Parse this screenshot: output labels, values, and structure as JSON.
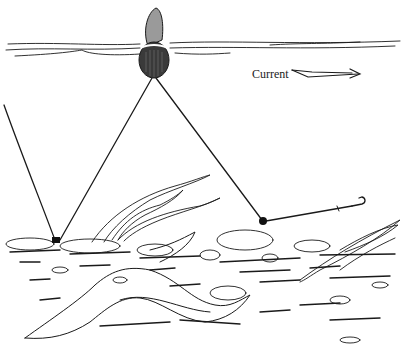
{
  "illustration": {
    "subject": "fishing float rig over riverbed",
    "current_label": "Current",
    "colors": {
      "ink": "#1a1a1a",
      "background": "#ffffff"
    },
    "elements": [
      {
        "name": "water-surface",
        "y": 45
      },
      {
        "name": "float",
        "cx": 154,
        "cy": 65
      },
      {
        "name": "anchor-sinker",
        "x": 56,
        "y": 241
      },
      {
        "name": "drift-sinker",
        "x": 263,
        "y": 221
      },
      {
        "name": "hook",
        "x": 361,
        "y": 205
      },
      {
        "name": "current-arrow",
        "x1": 292,
        "x2": 360,
        "y": 73
      }
    ]
  }
}
